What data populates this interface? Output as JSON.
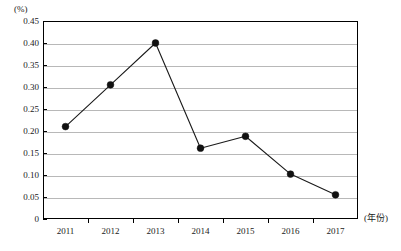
{
  "chart_data": {
    "type": "line",
    "title": "",
    "xlabel": "(年份)",
    "ylabel": "(%)",
    "categories": [
      "2011",
      "2012",
      "2013",
      "2014",
      "2015",
      "2016",
      "2017"
    ],
    "values": [
      0.21,
      0.305,
      0.4,
      0.161,
      0.188,
      0.102,
      0.055
    ],
    "series": [
      {
        "name": "",
        "values": [
          0.21,
          0.305,
          0.4,
          0.161,
          0.188,
          0.102,
          0.055
        ]
      }
    ],
    "ylim": [
      0,
      0.45
    ],
    "yticks": [
      "0",
      "0.05",
      "0.10",
      "0.15",
      "0.20",
      "0.25",
      "0.30",
      "0.35",
      "0.40",
      "0.45"
    ],
    "ytick_values": [
      0,
      0.05,
      0.1,
      0.15,
      0.2,
      0.25,
      0.3,
      0.35,
      0.4,
      0.45
    ],
    "grid": true,
    "legend": "none",
    "marker": "filled-circle",
    "line_color": "#1a1a1a",
    "grid_color": "#b8b8b8",
    "axis_color": "#000000",
    "background": "#ffffff"
  },
  "axes": {
    "y_unit": "(%)",
    "x_unit": "(年份)"
  }
}
